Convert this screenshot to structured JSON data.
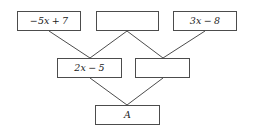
{
  "diagram": {
    "type": "pyramid-expression-wall",
    "rows": [
      {
        "level": 1,
        "nodes": [
          {
            "id": "t1",
            "label": "−5x + 7",
            "empty": false,
            "x": 17,
            "y": 11,
            "w": 64,
            "h": 20
          },
          {
            "id": "t2",
            "label": "",
            "empty": true,
            "x": 96,
            "y": 11,
            "w": 63,
            "h": 20
          },
          {
            "id": "t3",
            "label": "3x − 8",
            "empty": false,
            "x": 173,
            "y": 11,
            "w": 64,
            "h": 20
          }
        ]
      },
      {
        "level": 2,
        "nodes": [
          {
            "id": "m1",
            "label": "2x − 5",
            "empty": false,
            "x": 57,
            "y": 58,
            "w": 65,
            "h": 20
          },
          {
            "id": "m2",
            "label": "",
            "empty": true,
            "x": 135,
            "y": 58,
            "w": 55,
            "h": 20
          }
        ]
      },
      {
        "level": 3,
        "nodes": [
          {
            "id": "b1",
            "label": "A",
            "empty": false,
            "x": 95,
            "y": 105,
            "w": 65,
            "h": 20
          }
        ]
      }
    ],
    "connectors": [
      {
        "from": "t1",
        "to": "m1",
        "x1": 49,
        "y1": 31,
        "x2": 90,
        "y2": 58
      },
      {
        "from": "t2",
        "to": "m1",
        "x1": 127,
        "y1": 31,
        "x2": 90,
        "y2": 58
      },
      {
        "from": "t2",
        "to": "m2",
        "x1": 127,
        "y1": 31,
        "x2": 163,
        "y2": 58
      },
      {
        "from": "t3",
        "to": "m2",
        "x1": 205,
        "y1": 31,
        "x2": 163,
        "y2": 58
      },
      {
        "from": "m1",
        "to": "b1",
        "x1": 90,
        "y1": 78,
        "x2": 127,
        "y2": 105
      },
      {
        "from": "m2",
        "to": "b1",
        "x1": 163,
        "y1": 78,
        "x2": 127,
        "y2": 105
      }
    ],
    "style": {
      "box_border_color": "#4c4c4c",
      "box_fill_color": "#ffffff",
      "connector_color": "#4c4c4c",
      "text_color": "#1a1a1a",
      "background_color": "#ffffff"
    }
  }
}
